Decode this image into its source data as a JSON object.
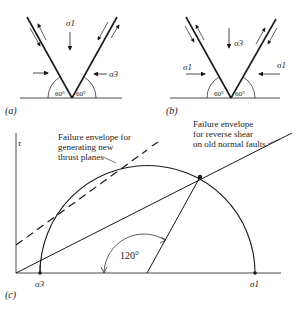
{
  "panels": {
    "a": {
      "label": "(a)",
      "sigma_vertical": "σ1",
      "sigma_horizontal": "σ3",
      "angle_left": "60°",
      "angle_right": "60°"
    },
    "b": {
      "label": "(b)",
      "sigma_vertical": "σ3",
      "sigma_horizontal_left": "σ1",
      "sigma_horizontal_right": "σ1",
      "angle_left": "60°",
      "angle_right": "60°"
    },
    "c": {
      "label": "(c)",
      "y_axis_label": "τ",
      "sigma3_label": "σ3",
      "sigma1_label": "σ1",
      "angle_label": "120°",
      "envelope_new": [
        "Failure envelope for",
        "generating new",
        "thrust planes"
      ],
      "envelope_old": [
        "Failure envelope",
        "for reverse shear",
        "on old normal faults"
      ]
    }
  },
  "colors": {
    "ink": "#1a1a1a",
    "background": "#ffffff"
  }
}
